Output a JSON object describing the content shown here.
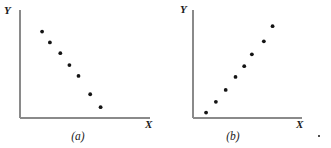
{
  "figure": {
    "width": 331,
    "height": 148,
    "background_color": "#ffffff",
    "axis_color": "#8a8a8a",
    "point_color": "#141414",
    "point_radius_px": 1.9,
    "stray_mark_label": "."
  },
  "panels": [
    {
      "id": "a",
      "caption": "(a)",
      "y_axis_label": "Y",
      "x_axis_label": "X",
      "chart_data": {
        "type": "scatter",
        "title": "(a)",
        "xlabel": "X",
        "ylabel": "Y",
        "grid": false,
        "legend": "none",
        "relationship": "negative linear",
        "xlim": [
          0,
          10
        ],
        "ylim": [
          0,
          10
        ],
        "x": [
          1.7,
          2.3,
          3.1,
          3.8,
          4.5,
          5.4,
          6.2
        ],
        "y": [
          8.0,
          7.0,
          6.0,
          4.9,
          3.9,
          2.2,
          1.0
        ],
        "n_points": 7
      }
    },
    {
      "id": "b",
      "caption": "(b)",
      "y_axis_label": "Y",
      "x_axis_label": "X",
      "chart_data": {
        "type": "scatter",
        "title": "(b)",
        "xlabel": "X",
        "ylabel": "Y",
        "grid": false,
        "legend": "none",
        "relationship": "positive linear",
        "xlim": [
          0,
          10
        ],
        "ylim": [
          0,
          10
        ],
        "x": [
          1.2,
          2.1,
          3.0,
          3.9,
          4.7,
          5.4,
          6.5,
          7.3
        ],
        "y": [
          0.5,
          1.5,
          2.6,
          3.8,
          4.8,
          5.9,
          7.1,
          8.5
        ],
        "n_points": 8
      }
    }
  ]
}
